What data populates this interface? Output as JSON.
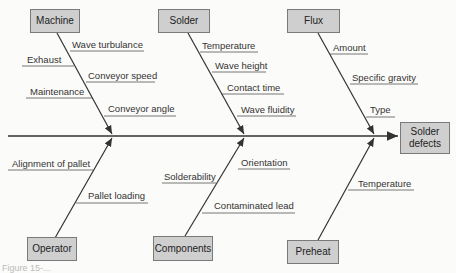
{
  "diagram": {
    "type": "fishbone",
    "effect": "Solder defects",
    "colors": {
      "box_fill": "#cfcfcf",
      "box_border": "#7a7a7a",
      "line": "#333333",
      "background": "#fbfbf9"
    },
    "categories": [
      {
        "name": "Machine",
        "causes": [
          "Wave turbulance",
          "Exhaust",
          "Conveyor speed",
          "Maintenance",
          "Conveyor angle"
        ]
      },
      {
        "name": "Solder",
        "causes": [
          "Temperature",
          "Wave height",
          "Contact time",
          "Wave fluidity"
        ]
      },
      {
        "name": "Flux",
        "causes": [
          "Amount",
          "Specific gravity",
          "Type"
        ]
      },
      {
        "name": "Operator",
        "causes": [
          "Alignment of pallet",
          "Pallet loading"
        ]
      },
      {
        "name": "Components",
        "causes": [
          "Orientation",
          "Solderability",
          "Contaminated lead"
        ]
      },
      {
        "name": "Preheat",
        "causes": [
          "Temperature"
        ]
      }
    ],
    "caption": "Figure 15-..."
  }
}
